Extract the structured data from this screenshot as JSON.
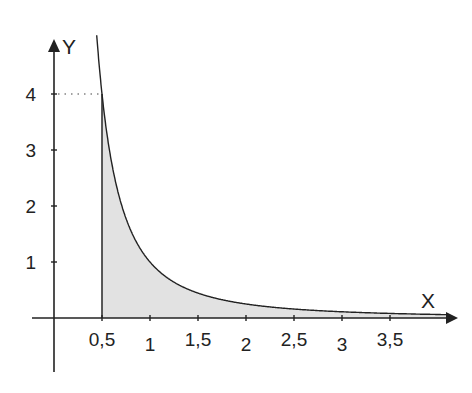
{
  "chart_data": {
    "type": "area",
    "title": "",
    "function": "y = 1/x^2",
    "xlabel": "X",
    "ylabel": "Y",
    "x_ticks": [
      0.5,
      1,
      1.5,
      2,
      2.5,
      3,
      3.5
    ],
    "x_tick_labels": [
      "0,5",
      "1",
      "1,5",
      "2",
      "2,5",
      "3",
      "3,5"
    ],
    "y_ticks": [
      1,
      2,
      3,
      4
    ],
    "y_tick_labels": [
      "1",
      "2",
      "3",
      "4"
    ],
    "xlim": [
      0,
      4.2
    ],
    "ylim": [
      0,
      5
    ],
    "shaded_region": {
      "from_x": 0.5,
      "to_x": 4.0,
      "description": "area under curve from x=0.5"
    },
    "annotations": [
      {
        "type": "dotted-guide",
        "from": [
          0,
          4
        ],
        "to": [
          0.5,
          4
        ]
      }
    ],
    "series": [
      {
        "name": "1/x^2",
        "x": [
          0.45,
          0.5,
          0.6,
          0.75,
          1,
          1.25,
          1.5,
          2,
          2.5,
          3,
          3.5,
          4
        ],
        "values": [
          4.94,
          4,
          2.78,
          1.78,
          1,
          0.64,
          0.44,
          0.25,
          0.16,
          0.11,
          0.08,
          0.06
        ]
      }
    ],
    "grid": false,
    "legend": "none",
    "colors": {
      "fill": "#e2e2e2",
      "line": "#222222",
      "axis": "#222222"
    }
  }
}
